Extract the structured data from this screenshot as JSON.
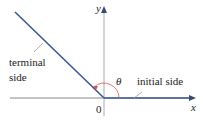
{
  "diagram": {
    "type": "angle-in-standard-position",
    "axes": {
      "x_label": "x",
      "y_label": "y",
      "origin_label": "0"
    },
    "angle_symbol": "θ",
    "labels": {
      "terminal_line1": "terminal",
      "terminal_line2": "side",
      "initial": "initial side"
    },
    "colors": {
      "ray": "#3b5998",
      "axis": "#777777",
      "arc": "#d9534f",
      "text": "#222222"
    }
  }
}
